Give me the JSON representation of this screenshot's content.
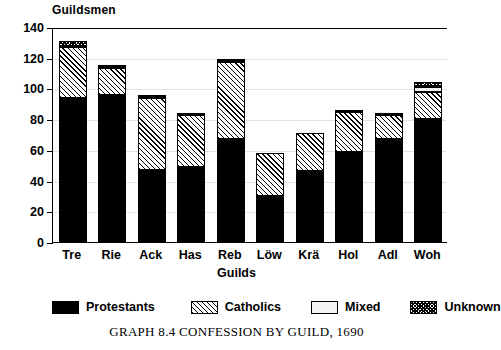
{
  "chart_data": {
    "type": "bar",
    "stacked": true,
    "title": "GRAPH 8.4   CONFESSION BY GUILD, 1690",
    "ylabel": "Guildsmen",
    "xlabel": "Guilds",
    "categories": [
      "Tre",
      "Rie",
      "Ack",
      "Has",
      "Reb",
      "Löw",
      "Krä",
      "Hol",
      "Adl",
      "Woh"
    ],
    "ylim": [
      0,
      140
    ],
    "yticks": [
      0,
      20,
      40,
      60,
      80,
      100,
      120,
      140
    ],
    "grid": true,
    "legend_position": "bottom",
    "series": [
      {
        "name": "Protestants",
        "pattern": "solid-black",
        "values": [
          94,
          96,
          47,
          49,
          67,
          30,
          46,
          59,
          67,
          80
        ]
      },
      {
        "name": "Catholics",
        "pattern": "diagonal-hatch",
        "values": [
          33,
          17,
          47,
          34,
          50,
          28,
          25,
          26,
          16,
          18
        ]
      },
      {
        "name": "Mixed",
        "pattern": "light-blank",
        "values": [
          0,
          0,
          0,
          0,
          0,
          0,
          0,
          0,
          0,
          3
        ]
      },
      {
        "name": "Unknown",
        "pattern": "cross-hatch",
        "values": [
          4,
          2,
          2,
          1,
          2,
          0,
          0,
          1,
          1,
          3
        ]
      }
    ],
    "totals": [
      131,
      115,
      96,
      84,
      119,
      58,
      71,
      86,
      84,
      104
    ]
  },
  "caption": "GRAPH 8.4   CONFESSION BY GUILD, 1690"
}
